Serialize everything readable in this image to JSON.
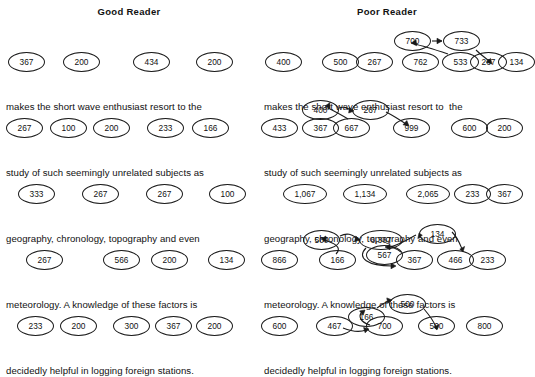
{
  "figure": {
    "background": "#ffffff",
    "ink": "#1a1a1a"
  },
  "columns": [
    {
      "id": "good-reader",
      "title": "Good Reader",
      "rows": [
        {
          "sentence": "makes the short wave enthusiast resort to the",
          "nodes": [
            {
              "label": "367",
              "x": 8,
              "y": 6,
              "w": 37,
              "h": 20
            },
            {
              "label": "200",
              "x": 63,
              "y": 6,
              "w": 37,
              "h": 20
            },
            {
              "label": "434",
              "x": 133,
              "y": 6,
              "w": 37,
              "h": 20
            },
            {
              "label": "200",
              "x": 196,
              "y": 6,
              "w": 37,
              "h": 20
            }
          ],
          "arrows": []
        },
        {
          "sentence": "study of such seemingly unrelated subjects as",
          "nodes": [
            {
              "label": "267",
              "x": 6,
              "y": 6,
              "w": 37,
              "h": 20
            },
            {
              "label": "100",
              "x": 50,
              "y": 6,
              "w": 37,
              "h": 20
            },
            {
              "label": "200",
              "x": 93,
              "y": 6,
              "w": 37,
              "h": 20
            },
            {
              "label": "233",
              "x": 147,
              "y": 6,
              "w": 37,
              "h": 20
            },
            {
              "label": "166",
              "x": 192,
              "y": 6,
              "w": 37,
              "h": 20
            }
          ],
          "arrows": []
        },
        {
          "sentence": "geography, chronology, topography and even",
          "nodes": [
            {
              "label": "333",
              "x": 18,
              "y": 6,
              "w": 37,
              "h": 20
            },
            {
              "label": "267",
              "x": 82,
              "y": 6,
              "w": 37,
              "h": 20
            },
            {
              "label": "267",
              "x": 146,
              "y": 6,
              "w": 37,
              "h": 20
            },
            {
              "label": "100",
              "x": 209,
              "y": 6,
              "w": 37,
              "h": 20
            }
          ],
          "arrows": []
        },
        {
          "sentence": "meteorology. A knowledge of these factors is",
          "nodes": [
            {
              "label": "267",
              "x": 26,
              "y": 6,
              "w": 37,
              "h": 20
            },
            {
              "label": "566",
              "x": 103,
              "y": 6,
              "w": 37,
              "h": 20
            },
            {
              "label": "200",
              "x": 151,
              "y": 6,
              "w": 37,
              "h": 20
            },
            {
              "label": "134",
              "x": 208,
              "y": 6,
              "w": 37,
              "h": 20
            }
          ],
          "arrows": []
        },
        {
          "sentence": "decidedly helpful in logging foreign stations.",
          "nodes": [
            {
              "label": "233",
              "x": 17,
              "y": 6,
              "w": 37,
              "h": 20
            },
            {
              "label": "200",
              "x": 60,
              "y": 6,
              "w": 37,
              "h": 20
            },
            {
              "label": "300",
              "x": 113,
              "y": 6,
              "w": 37,
              "h": 20
            },
            {
              "label": "367",
              "x": 155,
              "y": 6,
              "w": 37,
              "h": 20
            },
            {
              "label": "200",
              "x": 196,
              "y": 6,
              "w": 37,
              "h": 20
            }
          ],
          "arrows": []
        }
      ]
    },
    {
      "id": "poor-reader",
      "title": "Poor Reader",
      "rows": [
        {
          "sentence": "makes the short wave enthusiast resort to  the",
          "nodes": [
            {
              "label": "700",
              "x": 136,
              "y": -15,
              "w": 37,
              "h": 20
            },
            {
              "label": "733",
              "x": 185,
              "y": -15,
              "w": 37,
              "h": 20
            },
            {
              "label": "400",
              "x": 7,
              "y": 6,
              "w": 37,
              "h": 20
            },
            {
              "label": "500",
              "x": 64,
              "y": 6,
              "w": 37,
              "h": 20
            },
            {
              "label": "267",
              "x": 98,
              "y": 6,
              "w": 37,
              "h": 20
            },
            {
              "label": "762",
              "x": 144,
              "y": 6,
              "w": 37,
              "h": 20
            },
            {
              "label": "533",
              "x": 184,
              "y": 6,
              "w": 37,
              "h": 20
            },
            {
              "label": "267",
              "x": 212,
              "y": 6,
              "w": 37,
              "h": 20
            },
            {
              "label": "134",
              "x": 240,
              "y": 6,
              "w": 37,
              "h": 20
            }
          ],
          "arrows": [
            {
              "from": "700",
              "to": "733",
              "path": "M 174 -5 L 184 -5",
              "head": "M 184 -5 l -5 -2.8 l 0 5.6 z"
            },
            {
              "from": "733",
              "to": "267",
              "path": "M 218 4 C 224 10, 228 12, 232 16",
              "head": "M 234 18 l -1.5 -5.6 l -4.2 3.8 z"
            },
            {
              "from": "533",
              "to": "700",
              "path": "M 190 8 C 178 4, 166 0, 156 -2",
              "head": "M 153 -3 l 5 -2.9 l 0.6 5.6 z"
            }
          ]
        },
        {
          "sentence": "study of such seemingly unrelated subjects as",
          "nodes": [
            {
              "label": "400",
              "x": 44,
              "y": -12,
              "w": 37,
              "h": 20
            },
            {
              "label": "267",
              "x": 94,
              "y": -12,
              "w": 37,
              "h": 20
            },
            {
              "label": "433",
              "x": 3,
              "y": 6,
              "w": 37,
              "h": 20
            },
            {
              "label": "367",
              "x": 44,
              "y": 6,
              "w": 37,
              "h": 20
            },
            {
              "label": "667",
              "x": 75,
              "y": 6,
              "w": 37,
              "h": 20
            },
            {
              "label": "999",
              "x": 135,
              "y": 6,
              "w": 37,
              "h": 20
            },
            {
              "label": "600",
              "x": 193,
              "y": 6,
              "w": 37,
              "h": 20
            },
            {
              "label": "200",
              "x": 228,
              "y": 6,
              "w": 37,
              "h": 20
            }
          ],
          "arrows": [
            {
              "from": "400",
              "to": "267",
              "path": "M 81 -4 C 86 -6, 89 -4, 93 -2",
              "head": "M 96 -1 l -4.6 -3.6 l -0.7 5.6 z"
            },
            {
              "from": "267",
              "to": "999",
              "path": "M 128 0 C 136 4, 142 8, 148 12",
              "head": "M 151 14 l -2.2 -5.4 l -3.8 4.2 z"
            },
            {
              "from": "667",
              "to": "400",
              "path": "M 90 7 C 82 2, 76 -1, 70 -4",
              "head": "M 67 -6 l 4.8 -3.2 l 0.2 5.6 z"
            }
          ]
        },
        {
          "sentence": "geography, chronology, topography and even",
          "nodes": [
            {
              "label": "1,067",
              "x": 25,
              "y": 6,
              "w": 44,
              "h": 20
            },
            {
              "label": "1,134",
              "x": 85,
              "y": 6,
              "w": 44,
              "h": 20
            },
            {
              "label": "2,065",
              "x": 148,
              "y": 6,
              "w": 44,
              "h": 20
            },
            {
              "label": "233",
              "x": 196,
              "y": 6,
              "w": 37,
              "h": 20
            },
            {
              "label": "367",
              "x": 228,
              "y": 6,
              "w": 37,
              "h": 20
            }
          ],
          "arrows": []
        },
        {
          "sentence": "meteorology. A knowledge of these factors is",
          "nodes": [
            {
              "label": "500",
              "x": 45,
              "y": -14,
              "w": 37,
              "h": 20
            },
            {
              "label": "6,367",
              "x": 101,
              "y": -14,
              "w": 44,
              "h": 20
            },
            {
              "label": "134",
              "x": 161,
              "y": -20,
              "w": 37,
              "h": 20
            },
            {
              "label": "866",
              "x": 3,
              "y": 6,
              "w": 37,
              "h": 20
            },
            {
              "label": "166",
              "x": 61,
              "y": 6,
              "w": 37,
              "h": 20
            },
            {
              "label": "567",
              "x": 108,
              "y": 1,
              "w": 37,
              "h": 20
            },
            {
              "label": "367",
              "x": 138,
              "y": 6,
              "w": 37,
              "h": 20
            },
            {
              "label": "466",
              "x": 179,
              "y": 6,
              "w": 37,
              "h": 20
            },
            {
              "label": "233",
              "x": 211,
              "y": 6,
              "w": 37,
              "h": 20
            }
          ],
          "arrows": [
            {
              "from": "500",
              "to": "6,367",
              "path": "M 82 -8 C 90 -12, 94 -9, 99 -6",
              "head": "M 102 -4 l -4.2 -4 l -1.2 5.5 z"
            },
            {
              "from": "166",
              "to": "500",
              "path": "M 78 10 C 86 2, 72 -2, 66 -4",
              "head": "M 63 -5 l 4.9 -3 l 0.1 5.6 z"
            },
            {
              "from": "6,367",
              "to": "367",
              "path": "M 108 4 C 98 14, 110 22, 134 22",
              "head": "M 138 22 l -5 -2.8 l 0 5.6 z"
            },
            {
              "from": "367",
              "to": "567",
              "path": "M 143 8 C 138 4, 134 3, 130 3",
              "head": "M 127 3 l 5 -2.8 l 0 5.6 z"
            },
            {
              "from": "567",
              "to": "134",
              "path": "M 132 3 C 144 0, 152 -6, 158 -9",
              "head": "M 161 -11 l -1.2 5.6 l 4.5 -3.3 z",
              "flip": true
            },
            {
              "from": "134",
              "to": "466",
              "path": "M 194 -12 C 200 -6, 202 0, 204 5",
              "head": "M 205 8 l 1.6 -5.6 l -4.8 2.8 z"
            }
          ]
        },
        {
          "sentence": "decidedly helpful in logging foreign stations.",
          "nodes": [
            {
              "label": "500",
              "x": 131,
              "y": -16,
              "w": 37,
              "h": 20
            },
            {
              "label": "166",
              "x": 90,
              "y": -3,
              "w": 37,
              "h": 20
            },
            {
              "label": "600",
              "x": 3,
              "y": 6,
              "w": 37,
              "h": 20
            },
            {
              "label": "467",
              "x": 58,
              "y": 6,
              "w": 37,
              "h": 20
            },
            {
              "label": "700",
              "x": 108,
              "y": 6,
              "w": 37,
              "h": 20
            },
            {
              "label": "500",
              "x": 160,
              "y": 6,
              "w": 37,
              "h": 20
            },
            {
              "label": "800",
              "x": 208,
              "y": 6,
              "w": 37,
              "h": 20
            }
          ],
          "arrows": [
            {
              "from": "467",
              "to": "700",
              "path": "M 85 18 C 95 22, 103 22, 108 20",
              "head": "M 111 19 l -5.4 -1.6 l 1.5 5.4 z"
            },
            {
              "from": "166",
              "to": "500",
              "path": "M 119 -2 C 124 -6, 128 -8, 131 -9",
              "head": "M 134 -10 l -5.2 -2.1 l 0.9 5.5 z"
            },
            {
              "from": "500",
              "to": "500",
              "path": "M 166 -1 C 172 6, 176 12, 178 17",
              "head": "M 179 20 l 1.8 -5.5 l -5 2.6 z"
            },
            {
              "from": "700",
              "to": "166",
              "path": "M 112 15 C 102 12, 100 6, 104 2",
              "head": "M 107 0 l -5.4 0.9 l 3.6 4.3 z"
            }
          ]
        }
      ]
    }
  ],
  "layout": {
    "row_tops": [
      46,
      112,
      178,
      244,
      310
    ],
    "row_height": 66
  }
}
